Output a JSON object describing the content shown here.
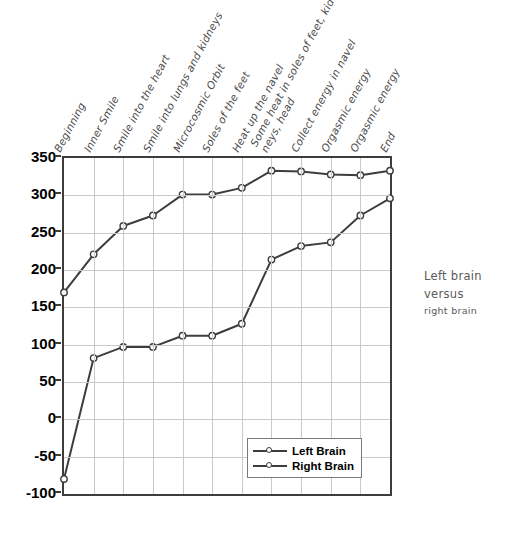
{
  "caption": {
    "line1": "Left brain versus",
    "line2": "right brain"
  },
  "legend": {
    "position": "inside-bottom-right",
    "items": [
      {
        "label": "Left Brain"
      },
      {
        "label": "Right Brain"
      }
    ]
  },
  "chart_data": {
    "type": "line",
    "title": "",
    "subtitle": "",
    "xlabel": "",
    "ylabel": "",
    "ylim": [
      -100,
      350
    ],
    "yticks": [
      -100,
      -50,
      0,
      50,
      100,
      150,
      200,
      250,
      300,
      350
    ],
    "ytick_labels": [
      "-100",
      "-50",
      "0",
      "50",
      "100",
      "150",
      "200",
      "250",
      "300",
      "350"
    ],
    "grid": true,
    "legend_position": "lower right",
    "categories": [
      "Beginning",
      "Inner Smile",
      "Smile into the heart",
      "Smile into lungs and kidneys",
      "Microcosmic Orbit",
      "Soles of the feet",
      "Heat up the navel",
      "Some heat in soles of feet, kid-|neys, head",
      "Collect energy in navel",
      "Orgasmic energy",
      "Orgasmic energy",
      "End"
    ],
    "category_lines": [
      [
        "Beginning"
      ],
      [
        "Inner Smile"
      ],
      [
        "Smile into the heart"
      ],
      [
        "Smile into lungs and kidneys"
      ],
      [
        "Microcosmic Orbit"
      ],
      [
        "Soles of the feet"
      ],
      [
        "Heat up the navel"
      ],
      [
        "Some heat in soles of feet, kid-",
        "neys, head"
      ],
      [
        "Collect energy in navel"
      ],
      [
        "Orgasmic energy"
      ],
      [
        "Orgasmic energy"
      ],
      [
        "End"
      ]
    ],
    "series": [
      {
        "name": "Left Brain",
        "color": "#3d3d3d",
        "marker": "circle-open",
        "values": [
          170,
          221,
          259,
          273,
          301,
          301,
          310,
          333,
          332,
          328,
          327,
          333
        ]
      },
      {
        "name": "Right Brain",
        "color": "#3d3d3d",
        "marker": "circle-open",
        "values": [
          -80,
          82,
          97,
          97,
          112,
          112,
          128,
          214,
          232,
          237,
          273,
          296
        ]
      }
    ]
  }
}
